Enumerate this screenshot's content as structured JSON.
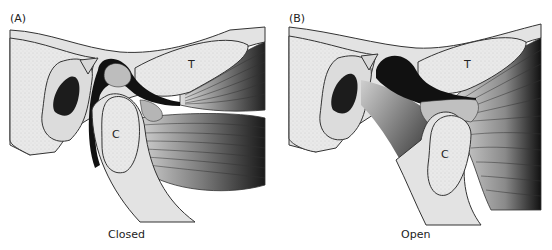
{
  "figure": {
    "panels": [
      {
        "label": "(A)",
        "caption": "Closed",
        "letters": {
          "temporal": "T",
          "condyle": "C"
        }
      },
      {
        "label": "(B)",
        "caption": "Open",
        "letters": {
          "temporal": "T",
          "condyle": "C"
        }
      }
    ],
    "colors": {
      "bone_fill": "#e6e6e6",
      "outline": "#333333",
      "dark": "#111111",
      "disc": "#bdbdbd",
      "muscle_mid": "#8a8a8a"
    }
  }
}
